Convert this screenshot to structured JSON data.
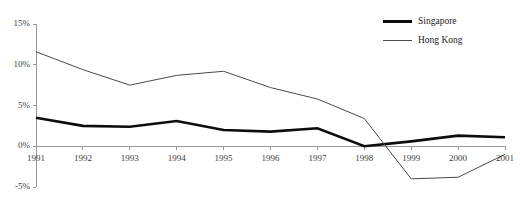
{
  "chart_data": {
    "type": "line",
    "title": "",
    "subtitle": "",
    "xlabel": "",
    "ylabel": "",
    "categories": [
      "1991",
      "1992",
      "1993",
      "1994",
      "1995",
      "1996",
      "1997",
      "1998",
      "1999",
      "2000",
      "2001"
    ],
    "series": [
      {
        "name": "Singapore",
        "color": "#0d0d0d",
        "line_width": 2.6,
        "values": [
          3.5,
          2.5,
          2.4,
          3.1,
          2.0,
          1.8,
          2.2,
          0.0,
          0.6,
          1.3,
          1.1
        ]
      },
      {
        "name": "Hong Kong",
        "color": "#4a4a4a",
        "line_width": 1.0,
        "values": [
          11.6,
          9.4,
          7.5,
          8.7,
          9.2,
          7.2,
          5.8,
          3.4,
          -4.0,
          -3.8,
          -1.0
        ]
      }
    ],
    "ylim": [
      -5,
      15
    ],
    "ytick_values": [
      15,
      10,
      5,
      0,
      -5
    ],
    "ytick_labels": [
      "15%",
      "10%",
      "5%",
      "0%",
      "-5%"
    ],
    "grid": false,
    "legend_position": "top-right",
    "axis_color": "#9a9a9a",
    "baseline_value": 0
  },
  "legend": {
    "entries": [
      {
        "label": "Singapore"
      },
      {
        "label": "Hong Kong"
      }
    ]
  }
}
